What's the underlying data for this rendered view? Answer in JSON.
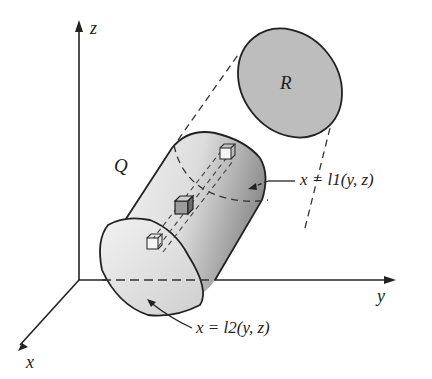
{
  "diagram": {
    "axes": {
      "z": "z",
      "y": "y",
      "x": "x"
    },
    "region_R": "R",
    "solid_Q": "Q",
    "surface_upper": "x = l1(y, z)",
    "surface_lower": "x = l2(y, z)",
    "colors": {
      "line": "#222222",
      "fill_R": "#bdbdbd",
      "fill_Q_light": "#eeeeee",
      "fill_Q_dark": "#9a9a9a"
    }
  }
}
